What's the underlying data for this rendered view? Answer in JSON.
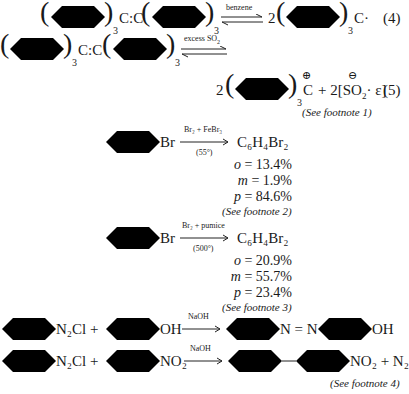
{
  "equation_4": {
    "reactant": "(C6H5)3C:C(C6H5)3",
    "reactant_left_center": "C:C",
    "subscript": "3",
    "arrow_label": "benzene",
    "coefficient": "2",
    "product_center": "C·",
    "number": "(4)"
  },
  "equation_5": {
    "reactant_left_center": "C:C",
    "subscript": "3",
    "arrow_label": "excess SO",
    "arrow_label_sub": "2",
    "coefficient": "2",
    "cation_center": "C",
    "plus_charge": "⊕",
    "minus_charge": "⊖",
    "plus": "+ 2[SO",
    "so2_sub": "2",
    "anion_tail": "· ε]",
    "number": "(5)",
    "footnote": "(See footnote 1)"
  },
  "reaction_fe": {
    "substituent": "Br",
    "arrow_label_top": "Br₂ + FeBr₃",
    "arrow_label_bottom": "(55°)",
    "product": "C₆H₄Br₂",
    "yields": [
      {
        "isomer": "o",
        "value": "13.4%"
      },
      {
        "isomer": "m",
        "value": "1.9%"
      },
      {
        "isomer": "p",
        "value": "84.6%"
      }
    ],
    "footnote": "(See footnote 2)"
  },
  "reaction_pumice": {
    "substituent": "Br",
    "arrow_label_top": "Br₂ + pumice",
    "arrow_label_bottom": "(500°)",
    "product": "C₆H₄Br₂",
    "yields": [
      {
        "isomer": "o",
        "value": "20.9%"
      },
      {
        "isomer": "m",
        "value": "55.7%"
      },
      {
        "isomer": "p",
        "value": "23.4%"
      }
    ],
    "footnote": "(See footnote 3)"
  },
  "coupling_1": {
    "reactant1_sub": "N₂Cl +",
    "reactant2_sub": "OH",
    "arrow_label": "NaOH",
    "product_mid": "N = N",
    "product_end": "OH"
  },
  "coupling_2": {
    "reactant1_sub": "N₂Cl +",
    "reactant2_sub": "NO₂",
    "arrow_label": "NaOH",
    "product_end": "NO₂ + N₂",
    "footnote": "(See footnote 4)"
  }
}
